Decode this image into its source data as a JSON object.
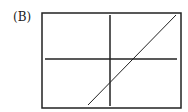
{
  "label": "(B)",
  "diagram": {
    "frame": {
      "x": 42,
      "y": 13,
      "width": 139,
      "height": 95
    },
    "x_axis_y": 59,
    "y_axis_x": 110,
    "line": {
      "x1": 88,
      "y1": 105,
      "x2": 176,
      "y2": 15
    },
    "colors": {
      "stroke": "#222222",
      "background": "#ffffff"
    }
  }
}
